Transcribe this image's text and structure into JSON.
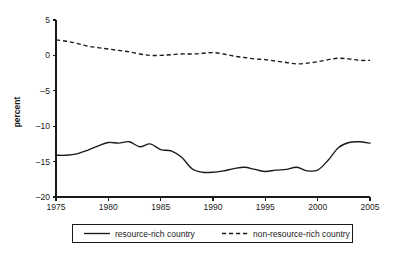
{
  "chart_data": {
    "type": "line",
    "title": "",
    "xlabel": "",
    "ylabel": "percent",
    "xlim": [
      1975,
      2005
    ],
    "ylim": [
      -20,
      5
    ],
    "grid": false,
    "legend_position": "bottom",
    "xticks": [
      1975,
      1980,
      1985,
      1990,
      1995,
      2000,
      2005
    ],
    "xtick_labels": [
      "1975",
      "1980",
      "1985",
      "1990",
      "1995",
      "2000",
      "2005"
    ],
    "yticks": [
      5,
      0,
      -5,
      -10,
      -15,
      -20
    ],
    "ytick_labels": [
      "5",
      "0",
      "-5",
      "-10",
      "-15",
      "-20"
    ],
    "x": [
      1975,
      1976,
      1977,
      1978,
      1979,
      1980,
      1981,
      1982,
      1983,
      1984,
      1985,
      1986,
      1987,
      1988,
      1989,
      1990,
      1991,
      1992,
      1993,
      1994,
      1995,
      1996,
      1997,
      1998,
      1999,
      2000,
      2001,
      2002,
      2003,
      2004,
      2005
    ],
    "series": [
      {
        "name": "resource-rich country",
        "style": "solid",
        "color": "#1a1a1a",
        "values": [
          -14.1,
          -14.1,
          -13.9,
          -13.4,
          -12.8,
          -12.3,
          -12.4,
          -12.2,
          -12.9,
          -12.5,
          -13.3,
          -13.5,
          -14.4,
          -16.0,
          -16.5,
          -16.5,
          -16.3,
          -16.0,
          -15.8,
          -16.1,
          -16.4,
          -16.2,
          -16.1,
          -15.8,
          -16.3,
          -16.2,
          -14.8,
          -13.0,
          -12.3,
          -12.2,
          -12.4
        ]
      },
      {
        "name": "non-resource-rich country",
        "style": "dashed",
        "color": "#1a1a1a",
        "values": [
          2.2,
          2.0,
          1.7,
          1.3,
          1.1,
          0.9,
          0.7,
          0.5,
          0.2,
          0.0,
          0.0,
          0.1,
          0.2,
          0.2,
          0.3,
          0.4,
          0.2,
          -0.1,
          -0.3,
          -0.5,
          -0.6,
          -0.8,
          -1.0,
          -1.2,
          -1.1,
          -0.9,
          -0.6,
          -0.4,
          -0.5,
          -0.7,
          -0.7
        ]
      }
    ],
    "legend": [
      {
        "label": "resource-rich country",
        "style": "solid"
      },
      {
        "label": "non-resource-rich country",
        "style": "dashed"
      }
    ]
  }
}
